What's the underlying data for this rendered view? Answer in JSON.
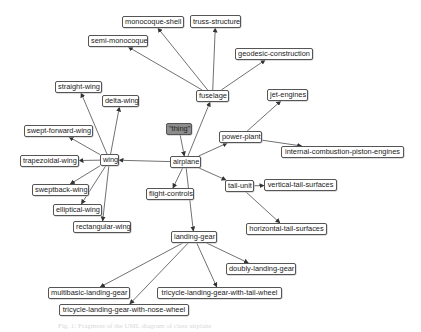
{
  "diagram": {
    "type": "class-hierarchy",
    "nodes": [
      {
        "id": "thing",
        "label": "\"thing\"",
        "style": "root"
      },
      {
        "id": "airplane",
        "label": "airplane"
      },
      {
        "id": "fuselage",
        "label": "fuselage"
      },
      {
        "id": "monocoque-shell",
        "label": "monocoque-shell"
      },
      {
        "id": "truss-structure",
        "label": "truss-structure"
      },
      {
        "id": "semi-monocoque",
        "label": "semi-monocoque"
      },
      {
        "id": "geodesic-construction",
        "label": "geodesic-construction"
      },
      {
        "id": "power-plant",
        "label": "power-plant"
      },
      {
        "id": "jet-engines",
        "label": "jet-engines"
      },
      {
        "id": "internal-combustion-piston-engines",
        "label": "internal-combustion-piston-engines"
      },
      {
        "id": "wing",
        "label": "wing"
      },
      {
        "id": "straight-wing",
        "label": "straight-wing"
      },
      {
        "id": "delta-wing",
        "label": "delta-wing"
      },
      {
        "id": "swept-forward-wing",
        "label": "swept-forward-wing"
      },
      {
        "id": "trapezoidal-wing",
        "label": "trapezoidal-wing"
      },
      {
        "id": "sweptback-wing",
        "label": "sweptback-wing"
      },
      {
        "id": "elliptical-wing",
        "label": "elliptical-wing"
      },
      {
        "id": "rectangular-wing",
        "label": "rectangular-wing"
      },
      {
        "id": "flight-controls",
        "label": "flight-controls"
      },
      {
        "id": "tail-unit",
        "label": "tail-unit"
      },
      {
        "id": "vertical-tail-surfaces",
        "label": "vertical-tail-surfaces"
      },
      {
        "id": "horizontal-tail-surfaces",
        "label": "horizontal-tail-surfaces"
      },
      {
        "id": "landing-gear",
        "label": "landing-gear"
      },
      {
        "id": "doubly-landing-gear",
        "label": "doubly-landing-gear"
      },
      {
        "id": "multibasic-landing-gear",
        "label": "multibasic-landing-gear"
      },
      {
        "id": "tricycle-landing-gear-with-tail-wheel",
        "label": "tricycle-landing-gear-with-tail-wheel"
      },
      {
        "id": "tricycle-landing-gear-with-nose-wheel",
        "label": "tricycle-landing-gear-with-nose-wheel"
      }
    ],
    "edges": [
      {
        "from": "thing",
        "to": "airplane"
      },
      {
        "from": "airplane",
        "to": "fuselage"
      },
      {
        "from": "airplane",
        "to": "power-plant"
      },
      {
        "from": "airplane",
        "to": "wing"
      },
      {
        "from": "airplane",
        "to": "flight-controls"
      },
      {
        "from": "airplane",
        "to": "tail-unit"
      },
      {
        "from": "airplane",
        "to": "landing-gear"
      },
      {
        "from": "fuselage",
        "to": "monocoque-shell"
      },
      {
        "from": "fuselage",
        "to": "truss-structure"
      },
      {
        "from": "fuselage",
        "to": "semi-monocoque"
      },
      {
        "from": "fuselage",
        "to": "geodesic-construction"
      },
      {
        "from": "power-plant",
        "to": "jet-engines"
      },
      {
        "from": "power-plant",
        "to": "internal-combustion-piston-engines"
      },
      {
        "from": "wing",
        "to": "straight-wing"
      },
      {
        "from": "wing",
        "to": "delta-wing"
      },
      {
        "from": "wing",
        "to": "swept-forward-wing"
      },
      {
        "from": "wing",
        "to": "trapezoidal-wing"
      },
      {
        "from": "wing",
        "to": "sweptback-wing"
      },
      {
        "from": "wing",
        "to": "elliptical-wing"
      },
      {
        "from": "wing",
        "to": "rectangular-wing"
      },
      {
        "from": "tail-unit",
        "to": "vertical-tail-surfaces"
      },
      {
        "from": "tail-unit",
        "to": "horizontal-tail-surfaces"
      },
      {
        "from": "landing-gear",
        "to": "doubly-landing-gear"
      },
      {
        "from": "landing-gear",
        "to": "multibasic-landing-gear"
      },
      {
        "from": "landing-gear",
        "to": "tricycle-landing-gear-with-tail-wheel"
      },
      {
        "from": "landing-gear",
        "to": "tricycle-landing-gear-with-nose-wheel"
      }
    ],
    "caption": "Fig. 1: Fragment of the UML diagram of class airplane"
  }
}
